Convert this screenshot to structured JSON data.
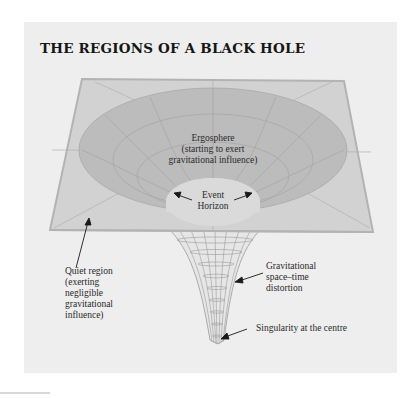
{
  "title": "THE REGIONS OF A BLACK HOLE",
  "labels": {
    "ergosphere": {
      "line1": "Ergosphere",
      "line2": "(starting to exert",
      "line3": "gravitational influence)"
    },
    "event_horizon": {
      "line1": "Event",
      "line2": "Horizon"
    },
    "quiet_region": {
      "line1": "Quiet region",
      "line2": "(exerting",
      "line3": "negligible",
      "line4": "gravitational",
      "line5": "influence)"
    },
    "distortion": {
      "line1": "Gravitational",
      "line2": "space–time",
      "line3": "distortion"
    },
    "singularity": {
      "line1": "Singularity at the centre"
    }
  },
  "colors": {
    "background": "#ffffff",
    "panel": "#eeeeee",
    "plane": "#d2d2d2",
    "plane_border": "#b3b3b3",
    "ergosphere": "#bcbcbc",
    "event_horizon": "#dadada",
    "grid": "#a8a8a8",
    "text": "#2a2a2a"
  }
}
